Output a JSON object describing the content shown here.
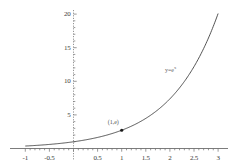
{
  "chart_data": {
    "type": "line",
    "title": "",
    "xlabel": "",
    "ylabel": "",
    "xlim": [
      -1,
      3
    ],
    "ylim": [
      0,
      20
    ],
    "grid": false,
    "legend": "none",
    "x_ticks": [
      "-1",
      "-0.5",
      "0.5",
      "1",
      "1.5",
      "2",
      "2.5",
      "3"
    ],
    "x_tick_values": [
      -1,
      -0.5,
      0.5,
      1,
      1.5,
      2,
      2.5,
      3
    ],
    "y_ticks": [
      "5",
      "10",
      "15",
      "20"
    ],
    "y_tick_values": [
      5,
      10,
      15,
      20
    ],
    "series": [
      {
        "name": "y = e^x",
        "label": "y=e",
        "label_exponent": "x",
        "color": "#404040",
        "x": [
          -1,
          -0.75,
          -0.5,
          -0.25,
          0,
          0.25,
          0.5,
          0.75,
          1,
          1.25,
          1.5,
          1.75,
          2,
          2.25,
          2.5,
          2.75,
          3
        ],
        "values": [
          0.37,
          0.47,
          0.61,
          0.78,
          1.0,
          1.28,
          1.65,
          2.12,
          2.72,
          3.49,
          4.48,
          5.75,
          7.39,
          9.49,
          12.18,
          15.64,
          20.09
        ]
      }
    ],
    "annotations": [
      {
        "name": "point-1-e",
        "text": "(1,e)",
        "x": 1,
        "y": 2.718,
        "marker": "dot",
        "marker_color": "#1a1a1a"
      }
    ],
    "axis_color": "#555555",
    "background": "#ffffff"
  }
}
